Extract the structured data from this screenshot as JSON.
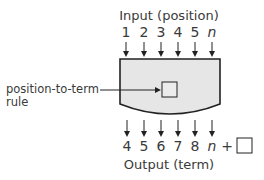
{
  "diagram": {
    "input_title": "Input (position)",
    "inputs": [
      "1",
      "2",
      "3",
      "4",
      "5",
      "n"
    ],
    "outputs": [
      "4",
      "5",
      "6",
      "7",
      "8",
      "n"
    ],
    "output_suffix": "+",
    "output_title": "Output (term)",
    "rule_label_line1": "position-to-term",
    "rule_label_line2": "rule",
    "colors": {
      "machine_fill": "#e6e6e6",
      "stroke": "#222222",
      "text": "#3a3a3a"
    }
  }
}
